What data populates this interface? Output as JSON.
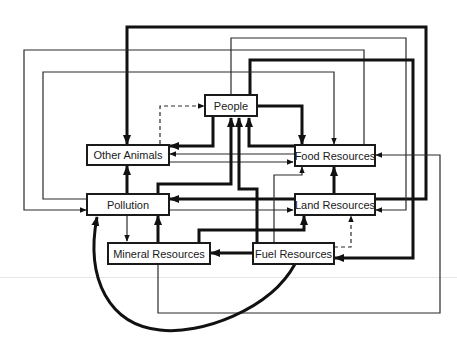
{
  "diagram": {
    "type": "flow-diagram",
    "nodes": [
      {
        "id": "people",
        "label": "People"
      },
      {
        "id": "other_animals",
        "label": "Other Animals"
      },
      {
        "id": "food_resources",
        "label": "Food Resources"
      },
      {
        "id": "pollution",
        "label": "Pollution"
      },
      {
        "id": "land_resources",
        "label": "Land Resources"
      },
      {
        "id": "mineral_resources",
        "label": "Mineral Resources"
      },
      {
        "id": "fuel_resources",
        "label": "Fuel Resources"
      }
    ],
    "edges": [
      {
        "from": "people",
        "to": "food_resources",
        "style": "thick"
      },
      {
        "from": "people",
        "to": "other_animals",
        "style": "thick"
      },
      {
        "from": "other_animals",
        "to": "people",
        "style": "dashed"
      },
      {
        "from": "food_resources",
        "to": "people",
        "style": "thick"
      },
      {
        "from": "pollution",
        "to": "people",
        "style": "thick"
      },
      {
        "from": "fuel_resources",
        "to": "people",
        "style": "thick"
      },
      {
        "from": "food_resources",
        "to": "other_animals",
        "style": "thin"
      },
      {
        "from": "other_animals",
        "to": "food_resources",
        "style": "thin"
      },
      {
        "from": "pollution",
        "to": "other_animals",
        "style": "thick"
      },
      {
        "from": "land_resources",
        "to": "other_animals",
        "style": "thick"
      },
      {
        "from": "people",
        "to": "land_resources",
        "style": "thin"
      },
      {
        "from": "people",
        "to": "fuel_resources",
        "style": "thick"
      },
      {
        "from": "food_resources",
        "to": "pollution",
        "style": "thin"
      },
      {
        "from": "pollution",
        "to": "food_resources",
        "style": "thin"
      },
      {
        "from": "land_resources",
        "to": "pollution",
        "style": "thick"
      },
      {
        "from": "pollution",
        "to": "land_resources",
        "style": "thin"
      },
      {
        "from": "land_resources",
        "to": "food_resources",
        "style": "thick"
      },
      {
        "from": "fuel_resources",
        "to": "food_resources",
        "style": "thin"
      },
      {
        "from": "mineral_resources",
        "to": "food_resources",
        "style": "thin"
      },
      {
        "from": "mineral_resources",
        "to": "land_resources",
        "style": "thick"
      },
      {
        "from": "fuel_resources",
        "to": "land_resources",
        "style": "dashed"
      },
      {
        "from": "pollution",
        "to": "mineral_resources",
        "style": "thin"
      },
      {
        "from": "mineral_resources",
        "to": "pollution",
        "style": "thick"
      },
      {
        "from": "fuel_resources",
        "to": "mineral_resources",
        "style": "thick"
      },
      {
        "from": "fuel_resources",
        "to": "pollution",
        "style": "thick-curve"
      }
    ]
  }
}
